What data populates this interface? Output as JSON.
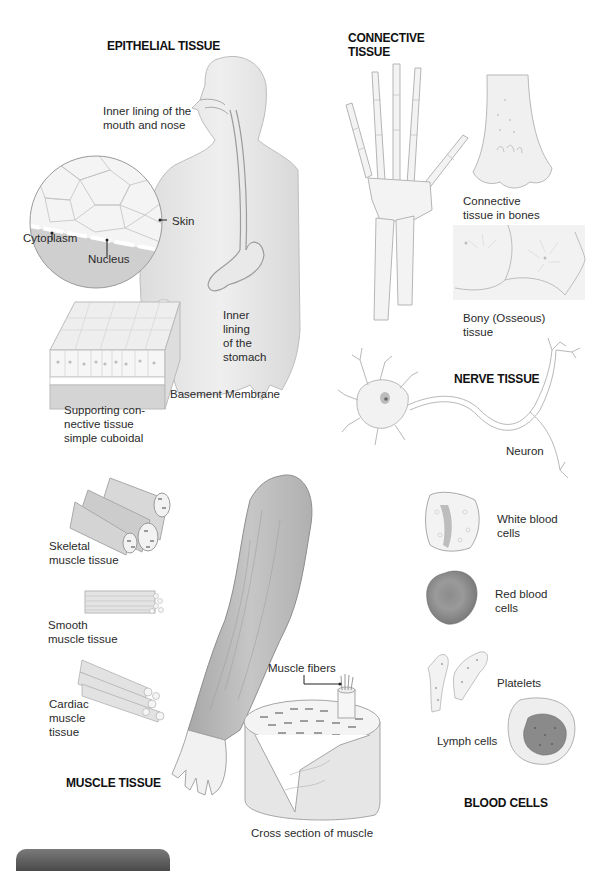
{
  "sections": {
    "epithelial": {
      "heading": "EPITHELIAL TISSUE",
      "labels": {
        "mouth_nose": "Inner lining of the\nmouth and nose",
        "skin": "Skin",
        "cytoplasm": "Cytoplasm",
        "nucleus": "Nucleus",
        "stomach": "Inner\nlining\nof the\nstomach",
        "basement_membrane": "Basement Membrane",
        "supporting": "Supporting con-\nnective tissue\nsimple cuboidal"
      }
    },
    "connective": {
      "heading": "CONNECTIVE\nTISSUE",
      "labels": {
        "bones": "Connective\ntissue in bones",
        "bony": "Bony (Osseous)\ntissue"
      }
    },
    "nerve": {
      "heading": "NERVE TISSUE",
      "labels": {
        "neuron": "Neuron"
      }
    },
    "muscle": {
      "heading": "MUSCLE TISSUE",
      "labels": {
        "skeletal": "Skeletal\nmuscle tissue",
        "smooth": "Smooth\nmuscle tissue",
        "cardiac": "Cardiac\nmuscle\ntissue",
        "fibers": "Muscle fibers",
        "cross_section": "Cross section of muscle"
      }
    },
    "blood": {
      "heading": "BLOOD CELLS",
      "labels": {
        "white": "White blood\ncells",
        "red": "Red blood\ncells",
        "platelets": "Platelets",
        "lymph": "Lymph cells"
      }
    }
  },
  "colors": {
    "line": "#9a9a9a",
    "fill_light": "#ececec",
    "fill_mid": "#d6d6d6",
    "fill_dark": "#8a8a8a",
    "footer_tab": "#5a5a5a"
  }
}
